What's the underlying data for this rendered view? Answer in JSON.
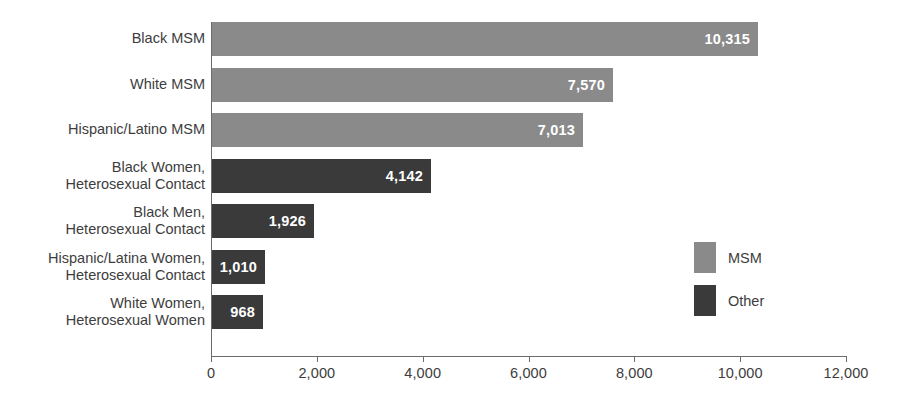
{
  "chart_data": {
    "type": "bar",
    "orientation": "horizontal",
    "title": "",
    "subtitle": "",
    "xlabel": "",
    "ylabel": "",
    "xlim": [
      0,
      12000
    ],
    "grid": false,
    "legend_position": "right-inside",
    "xticks": [
      0,
      2000,
      4000,
      6000,
      8000,
      10000,
      12000
    ],
    "xtick_labels": [
      "0",
      "2,000",
      "4,000",
      "6,000",
      "8,000",
      "10,000",
      "12,000"
    ],
    "categories": [
      "Black MSM",
      "White MSM",
      "Hispanic/Latino MSM",
      "Black Women,\nHeterosexual Contact",
      "Black Men,\nHeterosexual Contact",
      "Hispanic/Latina Women,\nHeterosexual Contact",
      "White Women,\nHeterosexual Women"
    ],
    "values": [
      10315,
      7570,
      7013,
      4142,
      1926,
      1010,
      968
    ],
    "value_labels": [
      "10,315",
      "7,570",
      "7,013",
      "4,142",
      "1,926",
      "1,010",
      "968"
    ],
    "groups": [
      "MSM",
      "MSM",
      "MSM",
      "Other",
      "Other",
      "Other",
      "Other"
    ],
    "series": [
      {
        "name": "MSM",
        "color": "#8a8a8a",
        "points": [
          {
            "category": "Black MSM",
            "value": 10315,
            "label": "10,315"
          },
          {
            "category": "White MSM",
            "value": 7570,
            "label": "7,570"
          },
          {
            "category": "Hispanic/Latino MSM",
            "value": 7013,
            "label": "7,013"
          }
        ]
      },
      {
        "name": "Other",
        "color": "#3a3a3a",
        "points": [
          {
            "category": "Black Women,\nHeterosexual Contact",
            "value": 4142,
            "label": "4,142"
          },
          {
            "category": "Black Men,\nHeterosexual Contact",
            "value": 1926,
            "label": "1,926"
          },
          {
            "category": "Hispanic/Latina Women,\nHeterosexual Contact",
            "value": 1010,
            "label": "1,010"
          },
          {
            "category": "White Women,\nHeterosexual Women",
            "value": 968,
            "label": "968"
          }
        ]
      }
    ],
    "legend": [
      {
        "label": "MSM",
        "color": "#8a8a8a"
      },
      {
        "label": "Other",
        "color": "#3a3a3a"
      }
    ]
  },
  "colors": {
    "msm": "#8a8a8a",
    "other": "#3a3a3a",
    "axis": "#6b6b6b",
    "text": "#3d3d3d",
    "value_text": "#ffffff",
    "background": "#ffffff"
  },
  "rows": [
    {
      "label": "Black MSM",
      "value_label": "10,315",
      "group": "msm",
      "lines": 1
    },
    {
      "label": "White MSM",
      "value_label": "7,570",
      "group": "msm",
      "lines": 1
    },
    {
      "label": "Hispanic/Latino MSM",
      "value_label": "7,013",
      "group": "msm",
      "lines": 1
    },
    {
      "label": "Black Women,\nHeterosexual Contact",
      "value_label": "4,142",
      "group": "other",
      "lines": 2
    },
    {
      "label": "Black Men,\nHeterosexual Contact",
      "value_label": "1,926",
      "group": "other",
      "lines": 2
    },
    {
      "label": "Hispanic/Latina Women,\nHeterosexual Contact",
      "value_label": "1,010",
      "group": "other",
      "lines": 2
    },
    {
      "label": "White Women,\nHeterosexual Women",
      "value_label": "968",
      "group": "other",
      "lines": 2
    }
  ],
  "legend": {
    "items": [
      {
        "label": "MSM",
        "group": "msm"
      },
      {
        "label": "Other",
        "group": "other"
      }
    ]
  },
  "axis": {
    "tick_labels": [
      "0",
      "2,000",
      "4,000",
      "6,000",
      "8,000",
      "10,000",
      "12,000"
    ]
  }
}
